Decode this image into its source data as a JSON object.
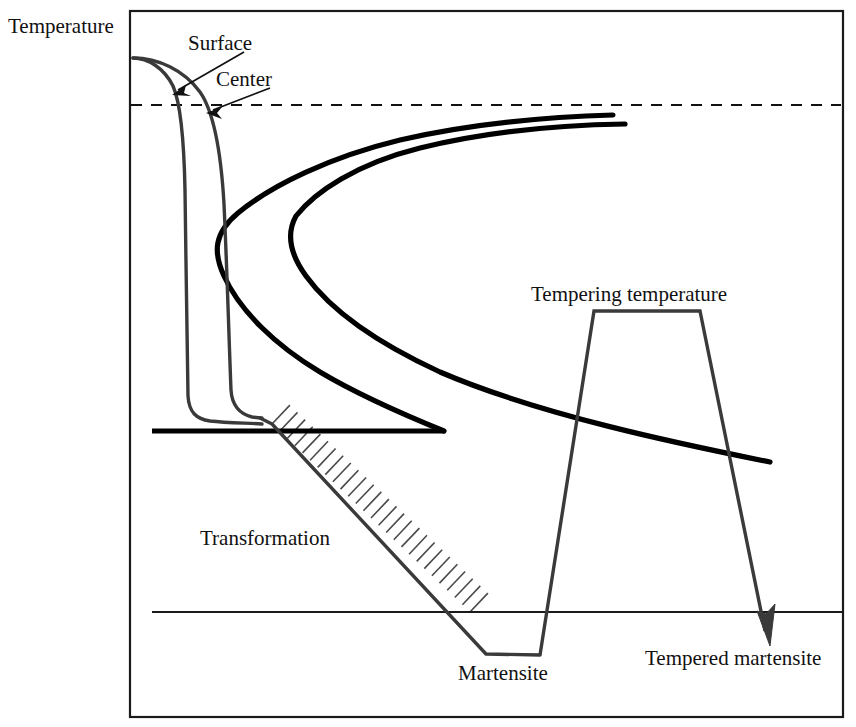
{
  "figure": {
    "title_axis_label": "Temperature",
    "background_color": "#ffffff",
    "frame_color": "#1a1a1a"
  },
  "labels": {
    "temperature": "Temperature",
    "surface": "Surface",
    "center": "Center",
    "tempering_temperature": "Tempering temperature",
    "transformation": "Transformation",
    "martensite": "Martensite",
    "tempered_martensite": "Tempered martensite"
  },
  "colors": {
    "curve_black": "#000000",
    "cooling_gray": "#3a3a3a",
    "hatch_gray": "#4a4a4a",
    "frame": "#1a1a1a"
  },
  "chart_data": {
    "type": "line",
    "title": "",
    "xlabel": "",
    "ylabel": "Temperature",
    "grid": false,
    "legend": "none",
    "plot_frame_px": {
      "x0": 130,
      "y0": 11,
      "x1": 843,
      "y1": 717
    },
    "annotations": [
      {
        "name": "temperature-axis-label",
        "text": "Temperature",
        "x": 8,
        "y": 33
      },
      {
        "name": "surface-label",
        "text": "Surface",
        "x": 188,
        "y": 50
      },
      {
        "name": "center-label",
        "text": "Center",
        "x": 216,
        "y": 86
      },
      {
        "name": "tempering-temperature-label",
        "text": "Tempering temperature",
        "x": 531,
        "y": 301
      },
      {
        "name": "transformation-label",
        "text": "Transformation",
        "x": 200,
        "y": 545
      },
      {
        "name": "martensite-label",
        "text": "Martensite",
        "x": 458,
        "y": 680
      },
      {
        "name": "tempered-martensite-label",
        "text": "Tempered martensite",
        "x": 645,
        "y": 665
      }
    ],
    "series": [
      {
        "name": "eutectoid-dashed-line",
        "kind": "dashed-horizontal",
        "y": 105,
        "x_start": 131,
        "x_end": 841
      },
      {
        "name": "ttt-nose-outer",
        "kind": "c-curve",
        "points": [
          [
            613,
            115
          ],
          [
            500,
            120
          ],
          [
            390,
            134
          ],
          [
            300,
            166
          ],
          [
            240,
            203
          ],
          [
            214,
            222
          ],
          [
            222,
            268
          ],
          [
            260,
            320
          ],
          [
            320,
            370
          ],
          [
            390,
            405
          ],
          [
            430,
            423
          ],
          [
            444,
            431
          ]
        ]
      },
      {
        "name": "ttt-nose-inner",
        "kind": "c-curve",
        "points": [
          [
            625,
            124
          ],
          [
            540,
            126
          ],
          [
            440,
            140
          ],
          [
            360,
            170
          ],
          [
            308,
            205
          ],
          [
            292,
            222
          ],
          [
            300,
            258
          ],
          [
            330,
            300
          ],
          [
            390,
            345
          ],
          [
            470,
            390
          ],
          [
            580,
            425
          ],
          [
            700,
            445
          ],
          [
            770,
            462
          ]
        ]
      },
      {
        "name": "surface-cooling-curve",
        "kind": "cooling",
        "points": [
          [
            133,
            58
          ],
          [
            152,
            62
          ],
          [
            168,
            76
          ],
          [
            178,
            100
          ],
          [
            184,
            140
          ],
          [
            186,
            200
          ],
          [
            187,
            300
          ],
          [
            188,
            390
          ],
          [
            190,
            412
          ],
          [
            200,
            420
          ],
          [
            240,
            423
          ],
          [
            262,
            424
          ]
        ]
      },
      {
        "name": "center-cooling-curve",
        "kind": "cooling",
        "points": [
          [
            133,
            58
          ],
          [
            165,
            62
          ],
          [
            195,
            78
          ],
          [
            214,
            110
          ],
          [
            224,
            160
          ],
          [
            228,
            240
          ],
          [
            230,
            330
          ],
          [
            232,
            395
          ],
          [
            240,
            414
          ],
          [
            262,
            418
          ]
        ]
      },
      {
        "name": "transformation-descent",
        "kind": "cooling",
        "points": [
          [
            262,
            418
          ],
          [
            272,
            422
          ],
          [
            488,
            655
          ],
          [
            540,
            655
          ]
        ]
      },
      {
        "name": "ms-line",
        "kind": "solid-horizontal-thick",
        "y": 431,
        "x_start": 152,
        "x_end": 444
      },
      {
        "name": "mf-line",
        "kind": "solid-horizontal-thin",
        "y": 612,
        "x_start": 152,
        "x_end": 843
      },
      {
        "name": "tempering-cycle",
        "kind": "temper-trapezoid",
        "points": [
          [
            540,
            655
          ],
          [
            541,
            648
          ],
          [
            594,
            311
          ],
          [
            700,
            311
          ],
          [
            768,
            636
          ]
        ],
        "arrow_tip": [
          770,
          645
        ]
      }
    ],
    "hatch_band": {
      "name": "transformation-hatching",
      "along": [
        [
          272,
          424
        ],
        [
          470,
          612
        ]
      ],
      "tick_length": 26,
      "tick_count": 26,
      "side": "right"
    }
  }
}
